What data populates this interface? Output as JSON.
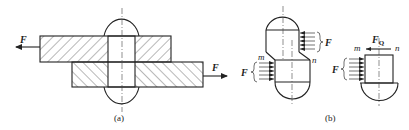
{
  "figure_a": {
    "caption": "(a)",
    "force_left_label": "F",
    "force_right_label": "F"
  },
  "figure_b": {
    "caption": "(b)",
    "body": {
      "force_upper_label": "F",
      "force_lower_label": "F",
      "section_left_label": "m",
      "section_right_label": "n"
    },
    "section": {
      "shear_force_label": "F",
      "shear_force_subscript": "Q",
      "section_left_label": "m",
      "section_right_label": "n",
      "applied_force_label": "F"
    }
  },
  "colors": {
    "line": "#222222",
    "background": "#ffffff"
  }
}
